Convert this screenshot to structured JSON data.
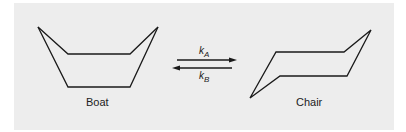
{
  "diagram": {
    "left_structure": {
      "label": "Boat"
    },
    "right_structure": {
      "label": "Chair"
    },
    "forward_rate": {
      "symbol": "k",
      "subscript": "A"
    },
    "reverse_rate": {
      "symbol": "k",
      "subscript": "B"
    },
    "colors": {
      "background": "#ededed",
      "stroke": "#1a1a1a"
    }
  }
}
